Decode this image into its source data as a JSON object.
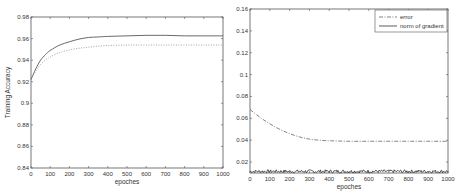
{
  "chart_data": [
    {
      "type": "line",
      "title": "",
      "xlabel": "epoches",
      "ylabel": "Training Accuracy",
      "xlim": [
        0,
        1000
      ],
      "ylim": [
        0.84,
        0.98
      ],
      "xticks": [
        0,
        100,
        200,
        300,
        400,
        500,
        600,
        700,
        800,
        900,
        1000
      ],
      "xtick_labels": [
        "0",
        "100",
        "200",
        "300",
        "400",
        "500",
        "600",
        "700",
        "800",
        "900",
        "1000"
      ],
      "yticks": [
        0.84,
        0.86,
        0.88,
        0.9,
        0.92,
        0.94,
        0.96,
        0.98
      ],
      "ytick_labels": [
        "0.84",
        "0.86",
        "0.88",
        "0.9",
        "0.92",
        "0.94",
        "0.96",
        "0.98"
      ],
      "grid": false,
      "legend": null,
      "x": [
        0,
        25,
        50,
        75,
        100,
        150,
        200,
        250,
        300,
        350,
        400,
        500,
        600,
        700,
        800,
        900,
        1000
      ],
      "series": [
        {
          "name": "solid",
          "style": "solid",
          "values": [
            0.922,
            0.932,
            0.94,
            0.945,
            0.949,
            0.954,
            0.957,
            0.9595,
            0.961,
            0.9615,
            0.962,
            0.9625,
            0.963,
            0.963,
            0.9625,
            0.9625,
            0.9625
          ]
        },
        {
          "name": "dotted",
          "style": "dotted",
          "values": [
            0.922,
            0.93,
            0.936,
            0.94,
            0.943,
            0.947,
            0.9495,
            0.951,
            0.952,
            0.953,
            0.9535,
            0.954,
            0.954,
            0.954,
            0.954,
            0.954,
            0.954
          ]
        }
      ]
    },
    {
      "type": "line",
      "title": "",
      "xlabel": "epoches",
      "ylabel": "",
      "xlim": [
        0,
        1000
      ],
      "ylim": [
        0.01,
        0.16
      ],
      "xticks": [
        0,
        100,
        200,
        300,
        400,
        500,
        600,
        700,
        800,
        900,
        1000
      ],
      "xtick_labels": [
        "0",
        "100",
        "200",
        "300",
        "400",
        "500",
        "600",
        "700",
        "800",
        "900",
        "1000"
      ],
      "yticks": [
        0.02,
        0.04,
        0.06,
        0.08,
        0.1,
        0.12,
        0.14,
        0.16
      ],
      "ytick_labels": [
        "0.02",
        "0.04",
        "0.06",
        "0.08",
        "0.1",
        "0.12",
        "0.14",
        "0.16"
      ],
      "grid": false,
      "legend": "top-right",
      "legend_entries": [
        "error",
        "norm of gradient"
      ],
      "x": [
        0,
        50,
        100,
        150,
        200,
        250,
        300,
        350,
        400,
        500,
        600,
        700,
        800,
        900,
        1000
      ],
      "series": [
        {
          "name": "error",
          "style": "dashdot",
          "values": [
            0.068,
            0.061,
            0.055,
            0.05,
            0.046,
            0.043,
            0.041,
            0.04,
            0.0395,
            0.039,
            0.039,
            0.039,
            0.039,
            0.039,
            0.039
          ]
        },
        {
          "name": "norm of gradient",
          "style": "solid-noisy",
          "mean": 0.0115,
          "noise_amplitude": 0.0015,
          "values": [
            0.0115,
            0.0115,
            0.0115,
            0.0115,
            0.0115,
            0.0115,
            0.0115,
            0.0115,
            0.0115,
            0.0115,
            0.0115,
            0.0115,
            0.0115,
            0.0115,
            0.0115
          ]
        }
      ]
    }
  ]
}
